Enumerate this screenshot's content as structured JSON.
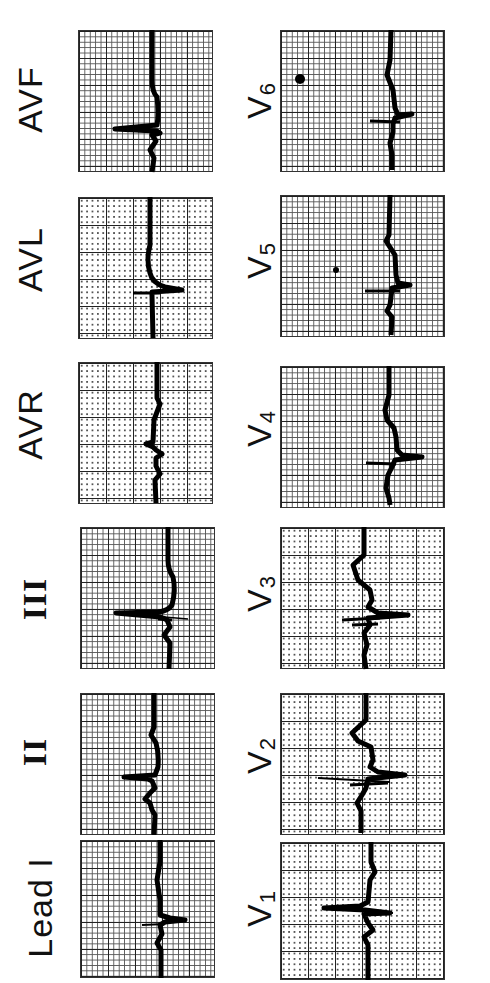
{
  "figure": {
    "orientation": "rotated-90-counterclockwise",
    "columns": [
      {
        "name": "limb-leads",
        "leads": [
          {
            "id": "avf",
            "label": "AVF"
          },
          {
            "id": "avl",
            "label": "AVL"
          },
          {
            "id": "avr",
            "label": "AVR"
          },
          {
            "id": "iii",
            "label": "III"
          },
          {
            "id": "ii",
            "label": "II"
          },
          {
            "id": "i",
            "label": "Lead I"
          }
        ]
      },
      {
        "name": "precordial-leads",
        "leads": [
          {
            "id": "v6",
            "label": "V",
            "sub": "6"
          },
          {
            "id": "v5",
            "label": "V",
            "sub": "5"
          },
          {
            "id": "v4",
            "label": "V",
            "sub": "4"
          },
          {
            "id": "v3",
            "label": "V",
            "sub": "3"
          },
          {
            "id": "v2",
            "label": "V",
            "sub": "2"
          },
          {
            "id": "v1",
            "label": "V",
            "sub": "1"
          }
        ]
      }
    ],
    "colors": {
      "background": "#ffffff",
      "grid": "#222222",
      "trace": "#000000"
    }
  }
}
